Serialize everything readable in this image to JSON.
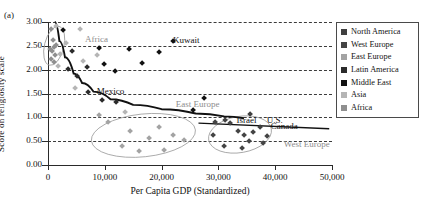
{
  "panel_label": "(a)",
  "legend": {
    "position": "right-outside",
    "entries": [
      {
        "label": "North America",
        "color": "#3f3f3f"
      },
      {
        "label": "West Europe",
        "color": "#444444"
      },
      {
        "label": "East Europe",
        "color": "#a3a3a3"
      },
      {
        "label": "Latin America",
        "color": "#2b2b2b"
      },
      {
        "label": "Middle East",
        "color": "#111111"
      },
      {
        "label": "Asia",
        "color": "#b5b5b5"
      },
      {
        "label": "Africa",
        "color": "#8f8f8f"
      }
    ]
  },
  "chart_data": {
    "type": "scatter",
    "title": "",
    "xlabel": "Per Capita GDP (Standardized)",
    "ylabel": "Score on religiosity scale",
    "xlim": [
      0,
      50000
    ],
    "ylim": [
      0,
      3.0
    ],
    "xticks": [
      0,
      10000,
      20000,
      30000,
      40000,
      50000
    ],
    "xticklabels": [
      "0",
      "10,000",
      "20,000",
      "30,000",
      "40,000",
      "50,000"
    ],
    "yticks": [
      0.0,
      0.5,
      1.0,
      1.5,
      2.0,
      2.5,
      3.0
    ],
    "yticklabels": [
      "0.00",
      "0.50",
      "1.00",
      "1.50",
      "2.00",
      "2.50",
      "3.00"
    ],
    "grid": "horizontal-dashed",
    "annotations": [
      {
        "text": "Kuwait",
        "x": 22000,
        "y": 2.6,
        "style": "black"
      },
      {
        "text": "Africa",
        "x": 6500,
        "y": 2.62,
        "style": "gray"
      },
      {
        "text": "Mexico",
        "x": 8600,
        "y": 1.53,
        "style": "black"
      },
      {
        "text": "East Europe",
        "x": 22500,
        "y": 1.26,
        "style": "gray"
      },
      {
        "text": "U.S.",
        "x": 38500,
        "y": 0.92,
        "style": "black"
      },
      {
        "text": "Israel",
        "x": 33200,
        "y": 0.92,
        "style": "black"
      },
      {
        "text": "Canada",
        "x": 39200,
        "y": 0.8,
        "style": "black"
      },
      {
        "text": "West Europe",
        "x": 41500,
        "y": 0.41,
        "style": "gray"
      }
    ],
    "series": [
      {
        "name": "North America",
        "color": "#3f3f3f",
        "points": [
          [
            35500,
            1.07
          ],
          [
            37300,
            0.8
          ]
        ]
      },
      {
        "name": "West Europe",
        "color": "#444444",
        "points": [
          [
            29500,
            0.9
          ],
          [
            31200,
            0.95
          ],
          [
            32100,
            0.88
          ],
          [
            33400,
            0.71
          ],
          [
            34500,
            0.62
          ],
          [
            35400,
            0.5
          ],
          [
            36100,
            0.7
          ],
          [
            37800,
            0.46
          ],
          [
            31000,
            0.4
          ],
          [
            34200,
            0.35
          ],
          [
            29000,
            0.62
          ],
          [
            38500,
            0.6
          ]
        ]
      },
      {
        "name": "East Europe",
        "color": "#a3a3a3",
        "points": [
          [
            10500,
            0.9
          ],
          [
            14500,
            0.72
          ],
          [
            17800,
            0.56
          ],
          [
            13000,
            0.4
          ],
          [
            19500,
            0.8
          ],
          [
            22000,
            0.62
          ],
          [
            9000,
            1.05
          ],
          [
            16000,
            0.3
          ],
          [
            24000,
            0.52
          ],
          [
            20500,
            0.32
          ]
        ]
      },
      {
        "name": "Latin America",
        "color": "#2b2b2b",
        "points": [
          [
            7000,
            1.53
          ],
          [
            9500,
            1.37
          ],
          [
            12000,
            1.33
          ],
          [
            5200,
            1.86
          ],
          [
            4200,
            2.38
          ],
          [
            6800,
            2.05
          ],
          [
            3600,
            2.02
          ]
        ]
      },
      {
        "name": "Middle East",
        "color": "#111111",
        "points": [
          [
            22000,
            2.6
          ],
          [
            9000,
            2.46
          ],
          [
            14200,
            2.44
          ],
          [
            19500,
            2.36
          ],
          [
            9800,
            2.12
          ],
          [
            16500,
            2.14
          ],
          [
            11800,
            1.96
          ],
          [
            2600,
            2.82
          ],
          [
            27500,
            1.4
          ],
          [
            25500,
            1.16
          ]
        ]
      },
      {
        "name": "Asia",
        "color": "#b5b5b5",
        "points": [
          [
            1400,
            2.92
          ],
          [
            5600,
            2.86
          ],
          [
            3100,
            2.56
          ],
          [
            6200,
            2.19
          ],
          [
            2200,
            2.33
          ],
          [
            8600,
            2.3
          ],
          [
            1800,
            2.07
          ],
          [
            4800,
            1.62
          ],
          [
            13500,
            1.1
          ]
        ]
      },
      {
        "name": "Africa",
        "color": "#8f8f8f",
        "points": [
          [
            600,
            2.86
          ],
          [
            900,
            2.62
          ],
          [
            1100,
            2.48
          ],
          [
            700,
            2.4
          ],
          [
            1300,
            2.3
          ],
          [
            500,
            2.22
          ],
          [
            1000,
            2.16
          ],
          [
            1500,
            2.52
          ],
          [
            400,
            2.44
          ]
        ]
      }
    ],
    "fit_curves": [
      {
        "name": "main-regression-curve",
        "kind": "decaying-power",
        "points": [
          [
            1200,
            3.0
          ],
          [
            2000,
            2.6
          ],
          [
            3000,
            2.26
          ],
          [
            4500,
            1.92
          ],
          [
            6000,
            1.72
          ],
          [
            8000,
            1.54
          ],
          [
            11000,
            1.38
          ],
          [
            15000,
            1.26
          ],
          [
            20000,
            1.17
          ],
          [
            26000,
            1.08
          ],
          [
            31000,
            1.02
          ],
          [
            34500,
            0.98
          ]
        ]
      },
      {
        "name": "right-linear-trend",
        "kind": "line",
        "points": [
          [
            26500,
            0.88
          ],
          [
            49500,
            0.76
          ]
        ]
      }
    ],
    "cluster_ellipses": [
      {
        "label": "Africa",
        "cx": 1100,
        "cy": 2.5,
        "rx": 1700,
        "ry": 0.42,
        "rot": 14
      },
      {
        "label": "East Europe",
        "cx": 16800,
        "cy": 0.62,
        "rx": 9200,
        "ry": 0.45,
        "rot": -6
      },
      {
        "label": "West Europe",
        "cx": 33800,
        "cy": 0.64,
        "rx": 5600,
        "ry": 0.38,
        "rot": -10
      }
    ]
  }
}
